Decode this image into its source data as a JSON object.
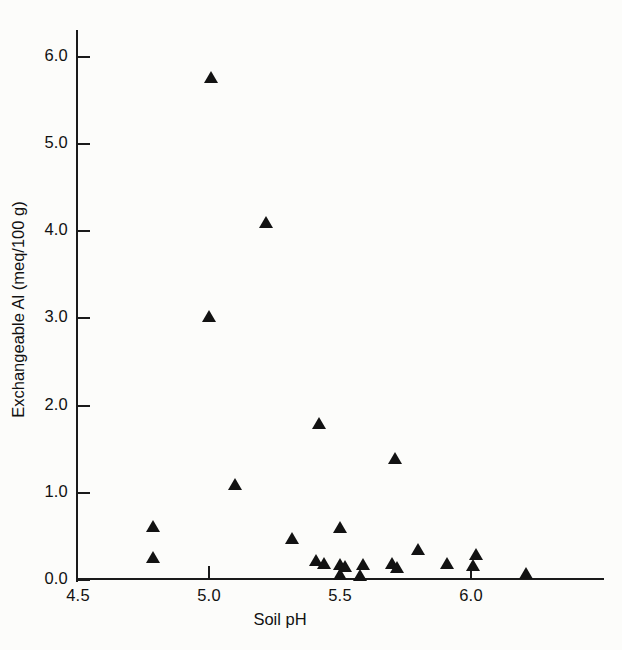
{
  "chart_data": {
    "type": "scatter",
    "title": "",
    "xlabel": "Soil pH",
    "ylabel": "Exchangeable Al (meq/100 g)",
    "xlim": [
      4.5,
      6.35
    ],
    "ylim": [
      0.0,
      6.35
    ],
    "xticks": [
      "4.5",
      "5.0",
      "5.5",
      "6.0"
    ],
    "xtick_values": [
      4.5,
      5.0,
      5.5,
      6.0
    ],
    "yticks": [
      "0.0",
      "1.0",
      "2.0",
      "3.0",
      "4.0",
      "5.0",
      "6.0"
    ],
    "ytick_values": [
      0.0,
      1.0,
      2.0,
      3.0,
      4.0,
      5.0,
      6.0
    ],
    "grid": false,
    "legend": "none",
    "marker": "filled-triangle",
    "marker_color": "#121212",
    "series": [
      {
        "name": "Soil samples",
        "points": [
          {
            "x": 5.01,
            "y": 5.75
          },
          {
            "x": 5.22,
            "y": 4.08
          },
          {
            "x": 5.0,
            "y": 3.0
          },
          {
            "x": 5.42,
            "y": 1.78
          },
          {
            "x": 5.71,
            "y": 1.38
          },
          {
            "x": 5.1,
            "y": 1.08
          },
          {
            "x": 4.79,
            "y": 0.6
          },
          {
            "x": 5.5,
            "y": 0.58
          },
          {
            "x": 5.32,
            "y": 0.46
          },
          {
            "x": 5.8,
            "y": 0.33
          },
          {
            "x": 6.02,
            "y": 0.28
          },
          {
            "x": 4.79,
            "y": 0.24
          },
          {
            "x": 5.41,
            "y": 0.21
          },
          {
            "x": 5.44,
            "y": 0.17
          },
          {
            "x": 5.5,
            "y": 0.16
          },
          {
            "x": 5.52,
            "y": 0.14
          },
          {
            "x": 5.59,
            "y": 0.16
          },
          {
            "x": 5.7,
            "y": 0.17
          },
          {
            "x": 5.72,
            "y": 0.13
          },
          {
            "x": 5.91,
            "y": 0.17
          },
          {
            "x": 6.01,
            "y": 0.15
          },
          {
            "x": 5.5,
            "y": 0.05
          },
          {
            "x": 5.58,
            "y": 0.03
          },
          {
            "x": 6.21,
            "y": 0.06
          }
        ]
      }
    ]
  },
  "axes": {
    "y_title": "Exchangeable Al (meq/100 g)",
    "x_title": "Soil pH"
  }
}
